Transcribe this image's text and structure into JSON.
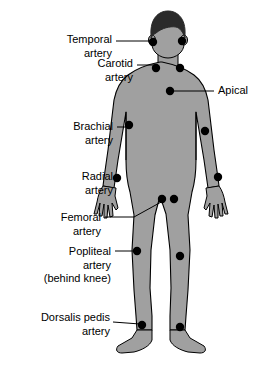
{
  "figure": {
    "background_color": "#ffffff",
    "body_fill": "#a0a0a0",
    "body_outline": "#000000",
    "hair_fill": "#2a2a2a",
    "dot_color": "#000000",
    "leader_line_color": "#000000"
  },
  "labels": [
    {
      "id": "temporal-artery",
      "lines": [
        "Temporal",
        "artery"
      ],
      "align": "right",
      "x": 22,
      "y": 33,
      "width": 90
    },
    {
      "id": "carotid-artery",
      "lines": [
        "Carotid",
        "artery"
      ],
      "align": "right",
      "x": 55,
      "y": 57,
      "width": 78
    },
    {
      "id": "apical",
      "lines": [
        "Apical"
      ],
      "align": "left",
      "x": 218,
      "y": 84,
      "width": 46
    },
    {
      "id": "brachial-artery",
      "lines": [
        "Brachial",
        "artery"
      ],
      "align": "right",
      "x": 37,
      "y": 120,
      "width": 76
    },
    {
      "id": "radial-artery",
      "lines": [
        "Radial",
        "artery"
      ],
      "align": "right",
      "x": 45,
      "y": 170,
      "width": 68
    },
    {
      "id": "femoral-artery",
      "lines": [
        "Femoral",
        "artery"
      ],
      "align": "right",
      "x": 23,
      "y": 211,
      "width": 78
    },
    {
      "id": "popliteal-artery",
      "lines": [
        "Popliteal",
        "artery",
        "(behind knee)"
      ],
      "align": "right",
      "x": 23,
      "y": 245,
      "width": 88
    },
    {
      "id": "dorsalis-pedis-artery",
      "lines": [
        "Dorsalis pedis",
        "artery"
      ],
      "align": "right",
      "x": 14,
      "y": 311,
      "width": 96
    }
  ],
  "pulse_points": [
    {
      "id": "temporal-left",
      "name": "Temporal artery",
      "cx": 153,
      "cy": 42
    },
    {
      "id": "temporal-right",
      "name": "Temporal artery",
      "cx": 182,
      "cy": 41
    },
    {
      "id": "carotid-left",
      "name": "Carotid artery",
      "cx": 156,
      "cy": 68
    },
    {
      "id": "carotid-right",
      "name": "Carotid artery",
      "cx": 180,
      "cy": 68
    },
    {
      "id": "apical",
      "name": "Apical",
      "cx": 170,
      "cy": 91
    },
    {
      "id": "brachial-left",
      "name": "Brachial artery",
      "cx": 129,
      "cy": 125
    },
    {
      "id": "brachial-right",
      "name": "Brachial artery",
      "cx": 205,
      "cy": 131
    },
    {
      "id": "radial-left",
      "name": "Radial artery",
      "cx": 117,
      "cy": 178
    },
    {
      "id": "radial-right",
      "name": "Radial artery",
      "cx": 218,
      "cy": 177
    },
    {
      "id": "femoral-left",
      "name": "Femoral artery",
      "cx": 162,
      "cy": 199
    },
    {
      "id": "femoral-right",
      "name": "Femoral artery",
      "cx": 174,
      "cy": 199
    },
    {
      "id": "popliteal-left",
      "name": "Popliteal artery",
      "cx": 137,
      "cy": 251
    },
    {
      "id": "popliteal-right",
      "name": "Popliteal artery",
      "cx": 180,
      "cy": 256
    },
    {
      "id": "dorsalis-pedis-left",
      "name": "Dorsalis pedis artery",
      "cx": 142,
      "cy": 325
    },
    {
      "id": "dorsalis-pedis-right",
      "name": "Dorsalis pedis artery",
      "cx": 180,
      "cy": 327
    }
  ],
  "leader_lines": [
    {
      "id": "temporal-leader",
      "x1": 116,
      "y1": 41,
      "x2": 150,
      "y2": 41
    },
    {
      "id": "carotid-leader",
      "x1": 137,
      "y1": 65,
      "x2": 154,
      "y2": 65
    },
    {
      "id": "apical-leader",
      "x1": 214,
      "y1": 91,
      "x2": 173,
      "y2": 91
    },
    {
      "id": "brachial-leader",
      "x1": 117,
      "y1": 127,
      "x2": 127,
      "y2": 127
    },
    {
      "id": "radial-leader",
      "x1": 117,
      "y1": 178,
      "x2": 114,
      "y2": 178
    },
    {
      "id": "femoral-leader-h",
      "x1": 105,
      "y1": 217,
      "x2": 134,
      "y2": 217
    },
    {
      "id": "femoral-leader-d",
      "x1": 134,
      "y1": 217,
      "x2": 163,
      "y2": 201
    },
    {
      "id": "popliteal-leader",
      "x1": 115,
      "y1": 251,
      "x2": 134,
      "y2": 251
    },
    {
      "id": "dorsalis-leader",
      "x1": 113,
      "y1": 322,
      "x2": 140,
      "y2": 324
    }
  ]
}
